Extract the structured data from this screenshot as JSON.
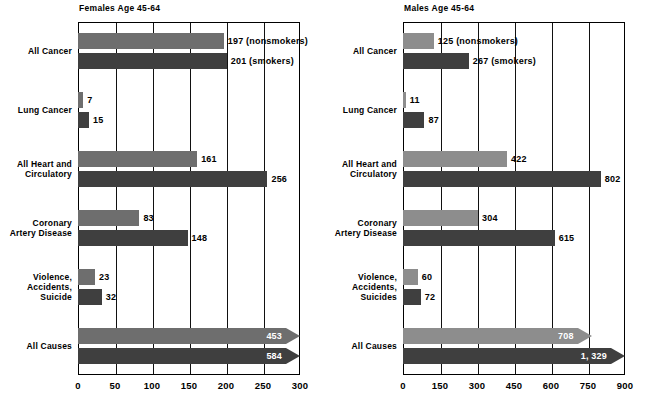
{
  "chart_data": [
    {
      "type": "bar",
      "title": "Females Age 45-64",
      "orientation": "horizontal",
      "xlabel": "",
      "ylabel": "",
      "xlim": [
        0,
        300
      ],
      "xticks": [
        "0",
        "50",
        "100",
        "150",
        "200",
        "250",
        "300"
      ],
      "grid": true,
      "legend": "inline value labels",
      "categories": [
        "All Cancer",
        "Lung Cancer",
        "All Heart and Circulatory",
        "Coronary Artery Disease",
        "Violence, Accidents, Suicide",
        "All Causes"
      ],
      "series": [
        {
          "name": "nonsmokers",
          "color": "#6e6e6e",
          "values": [
            197,
            7,
            161,
            83,
            23,
            453
          ]
        },
        {
          "name": "smokers",
          "color": "#3f3f3f",
          "values": [
            201,
            15,
            256,
            148,
            32,
            584
          ]
        }
      ],
      "labels": {
        "nonsmokers": [
          "197 (nonsmokers)",
          "7",
          "161",
          "83",
          "23",
          "453"
        ],
        "smokers": [
          "201 (smokers)",
          "15",
          "256",
          "148",
          "32",
          "584"
        ]
      },
      "overflow_rows": [
        "All Causes"
      ]
    },
    {
      "type": "bar",
      "title": "Males Age 45-64",
      "orientation": "horizontal",
      "xlabel": "",
      "ylabel": "",
      "xlim": [
        0,
        900
      ],
      "xticks": [
        "0",
        "150",
        "300",
        "450",
        "600",
        "750",
        "900"
      ],
      "grid": true,
      "legend": "inline value labels",
      "categories": [
        "All Cancer",
        "Lung Cancer",
        "All Heart and Circulatory",
        "Coronary Artery Disease",
        "Violence, Accidents, Suicides",
        "All Causes"
      ],
      "series": [
        {
          "name": "nonsmokers",
          "color": "#8d8d8d",
          "values": [
            125,
            11,
            422,
            304,
            60,
            708
          ]
        },
        {
          "name": "smokers",
          "color": "#3f3f3f",
          "values": [
            267,
            87,
            802,
            615,
            72,
            1329
          ]
        }
      ],
      "labels": {
        "nonsmokers": [
          "125 (nonsmokers)",
          "11",
          "422",
          "304",
          "60",
          "708"
        ],
        "smokers": [
          "267 (smokers)",
          "87",
          "802",
          "615",
          "72",
          "1, 329"
        ]
      },
      "overflow_rows": [
        "All Causes"
      ]
    }
  ]
}
